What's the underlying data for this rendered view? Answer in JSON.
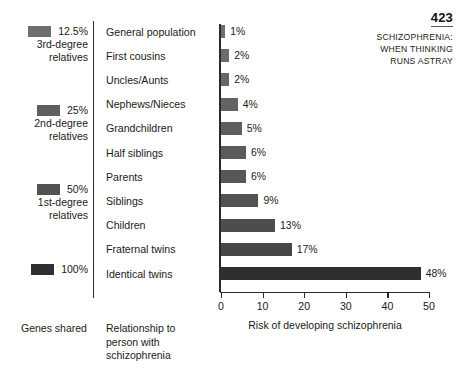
{
  "header": {
    "page_number": "423",
    "running_head_lines": [
      "SCHIZOPHRENIA:",
      "WHEN THINKING",
      "RUNS ASTRAY"
    ],
    "running_head": "SCHIZOPHRENIA:\nWHEN THINKING\nRUNS ASTRAY"
  },
  "legend": {
    "caption": "Genes shared",
    "items": [
      {
        "percent": "12.5%",
        "description": "3rd-degree\nrelatives",
        "color": "#6e6e6e",
        "top": 5
      },
      {
        "percent": "25%",
        "description": "2nd-degree\nrelatives",
        "color": "#5f5f5f",
        "top": 84
      },
      {
        "percent": "50%",
        "description": "1st-degree\nrelatives",
        "color": "#525252",
        "top": 163
      },
      {
        "percent": "100%",
        "description": "",
        "color": "#2f2f2f",
        "top": 243
      }
    ]
  },
  "categories_caption": "Relationship to\nperson with\nschizophrenia",
  "chart_data": {
    "type": "bar",
    "orientation": "horizontal",
    "title": "",
    "xlabel": "Risk of developing schizophrenia",
    "ylabel": "",
    "xlim": [
      0,
      50
    ],
    "xticks": [
      0,
      10,
      20,
      30,
      40,
      50
    ],
    "xtick_labels": [
      "0",
      "10",
      "20",
      "30",
      "40",
      "50"
    ],
    "grid": false,
    "legend_position": "left",
    "categories": [
      "General population",
      "First cousins",
      "Uncles/Aunts",
      "Nephews/Nieces",
      "Grandchildren",
      "Half siblings",
      "Parents",
      "Siblings",
      "Children",
      "Fraternal twins",
      "Identical twins"
    ],
    "values": [
      1,
      2,
      2,
      4,
      5,
      6,
      6,
      9,
      13,
      17,
      48
    ],
    "value_labels": [
      "1%",
      "2%",
      "2%",
      "4%",
      "5%",
      "6%",
      "6%",
      "9%",
      "13%",
      "17%",
      "48%"
    ],
    "bar_colors": [
      "#6e6e6e",
      "#6b6b6b",
      "#676767",
      "#636363",
      "#5f5f5f",
      "#5b5b5b",
      "#575757",
      "#525252",
      "#4d4d4d",
      "#474747",
      "#2f2f2f"
    ],
    "genes_shared_groups": [
      {
        "label": "12.5%",
        "group": "3rd-degree relatives",
        "categories": [
          "General population",
          "First cousins"
        ]
      },
      {
        "label": "25%",
        "group": "2nd-degree relatives",
        "categories": [
          "Uncles/Aunts",
          "Nephews/Nieces",
          "Grandchildren",
          "Half siblings"
        ]
      },
      {
        "label": "50%",
        "group": "1st-degree relatives",
        "categories": [
          "Parents",
          "Siblings",
          "Children",
          "Fraternal twins"
        ]
      },
      {
        "label": "100%",
        "group": "",
        "categories": [
          "Identical twins"
        ]
      }
    ]
  }
}
